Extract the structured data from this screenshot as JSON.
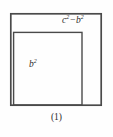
{
  "figure": {
    "caption": "(1)",
    "type": "geometric-diagram",
    "background_color": "#fefefe",
    "stroke_color": "#4a4a4a",
    "text_color": "#2b2b2b",
    "labels": {
      "outer_region": {
        "base_1": "c",
        "exponent_1": "2",
        "operator": "−",
        "base_2": "b",
        "exponent_2": "2",
        "plain": "c²−b²"
      },
      "inner_region": {
        "base": "b",
        "exponent": "2",
        "plain": "b²"
      }
    },
    "shapes": {
      "outer_square": {
        "name": "outer-square",
        "x": 10,
        "y": 13,
        "width": 91,
        "height": 92,
        "stroke_width": 1.6
      },
      "inner_square": {
        "name": "inner-square",
        "x": 13,
        "y": 32,
        "width": 69,
        "height": 73,
        "stroke_width": 1.4
      }
    }
  }
}
